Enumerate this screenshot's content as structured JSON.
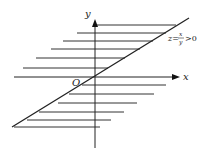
{
  "diagram": {
    "axes": {
      "x_label": "x",
      "y_label": "y",
      "origin_label": "O"
    },
    "curve_label": {
      "lhs": "z=",
      "numerator": "x",
      "denominator": "y",
      "rhs": ">0"
    },
    "colors": {
      "line": "#222222",
      "background": "#ffffff"
    },
    "geometry": {
      "diagonal": {
        "x1": 12,
        "y1": 127,
        "x2": 189,
        "y2": 18
      },
      "x_axis": {
        "x1": 14,
        "y1": 77,
        "x2": 176,
        "y2": 77
      },
      "y_axis": {
        "x1": 95,
        "y1": 24,
        "x2": 95,
        "y2": 148
      },
      "hatch_upper": [
        {
          "y": 25,
          "x1": 97,
          "x2": 176
        },
        {
          "y": 33,
          "x1": 77,
          "x2": 166
        },
        {
          "y": 41,
          "x1": 63,
          "x2": 153
        },
        {
          "y": 49,
          "x1": 51,
          "x2": 140
        },
        {
          "y": 58,
          "x1": 36,
          "x2": 125
        },
        {
          "y": 68,
          "x1": 23,
          "x2": 108
        }
      ],
      "hatch_lower": [
        {
          "y": 85,
          "x1": 82,
          "x2": 166
        },
        {
          "y": 94,
          "x1": 69,
          "x2": 154
        },
        {
          "y": 103,
          "x1": 58,
          "x2": 137
        },
        {
          "y": 112,
          "x1": 39,
          "x2": 124
        },
        {
          "y": 120,
          "x1": 27,
          "x2": 111
        },
        {
          "y": 127,
          "x1": 14,
          "x2": 100
        }
      ]
    }
  }
}
